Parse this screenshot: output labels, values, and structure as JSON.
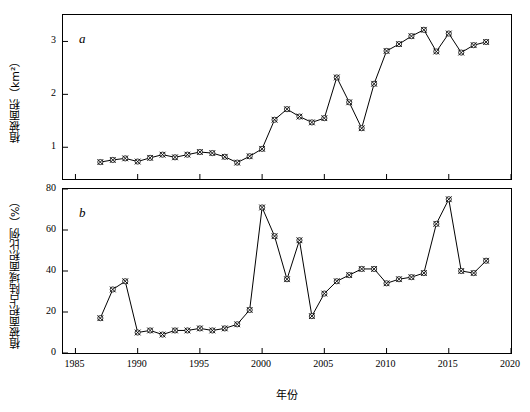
{
  "figure": {
    "xlabel": "年份",
    "panel_a_letter": "a",
    "panel_b_letter": "b",
    "ylabel_a": "植被面积（km²）",
    "ylabel_b": "植被面积占陆域面积比例（%）"
  },
  "chart_data": [
    {
      "type": "line",
      "panel": "a",
      "title": "",
      "xlabel": "年份",
      "ylabel": "植被面积（km²）",
      "xlim": [
        1984,
        2020
      ],
      "ylim": [
        0.4,
        3.5
      ],
      "xticks": [
        1985,
        1990,
        1995,
        2000,
        2005,
        2010,
        2015,
        2020
      ],
      "yticks": [
        1,
        2,
        3
      ],
      "grid": false,
      "legend": "none",
      "marker": "cross-in-circle",
      "x": [
        1987,
        1988,
        1989,
        1990,
        1991,
        1992,
        1993,
        1994,
        1995,
        1996,
        1997,
        1998,
        1999,
        2000,
        2001,
        2002,
        2003,
        2004,
        2005,
        2006,
        2007,
        2008,
        2009,
        2010,
        2011,
        2012,
        2013,
        2014,
        2015,
        2016,
        2017,
        2018
      ],
      "values": [
        0.72,
        0.76,
        0.79,
        0.73,
        0.8,
        0.86,
        0.81,
        0.86,
        0.91,
        0.89,
        0.82,
        0.71,
        0.83,
        0.97,
        1.52,
        1.72,
        1.58,
        1.47,
        1.55,
        2.32,
        1.85,
        1.36,
        2.2,
        2.82,
        2.95,
        3.1,
        3.22,
        2.81,
        3.15,
        2.79,
        2.93,
        2.99
      ]
    },
    {
      "type": "line",
      "panel": "b",
      "title": "",
      "xlabel": "年份",
      "ylabel": "植被面积占陆域面积比例（%）",
      "xlim": [
        1984,
        2020
      ],
      "ylim": [
        0,
        80
      ],
      "xticks": [
        1985,
        1990,
        1995,
        2000,
        2005,
        2010,
        2015,
        2020
      ],
      "yticks": [
        0,
        20,
        40,
        60,
        80
      ],
      "grid": false,
      "legend": "none",
      "marker": "cross-in-circle",
      "x": [
        1987,
        1988,
        1989,
        1990,
        1991,
        1992,
        1993,
        1994,
        1995,
        1996,
        1997,
        1998,
        1999,
        2000,
        2001,
        2002,
        2003,
        2004,
        2005,
        2006,
        2007,
        2008,
        2009,
        2010,
        2011,
        2012,
        2013,
        2014,
        2015,
        2016,
        2017,
        2018
      ],
      "values": [
        17,
        31,
        35,
        10,
        11,
        9,
        11,
        11,
        12,
        11,
        12,
        14,
        21,
        71,
        57,
        36,
        55,
        18,
        29,
        35,
        38,
        41,
        41,
        34,
        36,
        37,
        39,
        63,
        75,
        40,
        39,
        45
      ]
    }
  ]
}
